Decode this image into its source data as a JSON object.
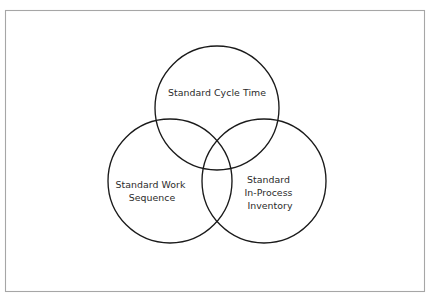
{
  "diagram": {
    "type": "venn",
    "set_count": 3,
    "background_color": "#ffffff",
    "frame": {
      "name": "outer-frame",
      "stroke_color": "#a6a6a6"
    },
    "circle_stroke_color": "#1a1a1a",
    "text_color": "#2b2b2b",
    "sets": [
      {
        "id": "standard-cycle-time",
        "position": "top",
        "label_lines": [
          "Standard Cycle Time"
        ],
        "line1": "Standard Cycle Time",
        "cx": 217,
        "cy": 108,
        "r": 62
      },
      {
        "id": "standard-work-sequence",
        "position": "bottom-left",
        "label_lines": [
          "Standard Work",
          "Sequence"
        ],
        "line1": "Standard Work",
        "line2": "Sequence",
        "cx": 170,
        "cy": 181,
        "r": 62
      },
      {
        "id": "standard-in-process-inventory",
        "position": "bottom-right",
        "label_lines": [
          "Standard",
          "In-Process",
          "Inventory"
        ],
        "line1": "Standard",
        "line2": "In-Process",
        "line3": "Inventory",
        "cx": 264,
        "cy": 181,
        "r": 62
      }
    ]
  }
}
